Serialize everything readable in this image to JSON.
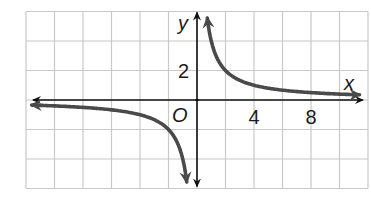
{
  "chart_data": {
    "type": "line",
    "title": "",
    "function": "y = 4/x",
    "xlabel": "x",
    "ylabel": "y",
    "origin_label": "O",
    "xlim": [
      -12,
      12
    ],
    "ylim": [
      -6,
      6
    ],
    "grid": true,
    "grid_step": 2,
    "x_tick_labels": [
      {
        "value": 4,
        "label": "4"
      },
      {
        "value": 8,
        "label": "8"
      }
    ],
    "y_tick_labels": [
      {
        "value": 2,
        "label": "2"
      }
    ],
    "series": [
      {
        "name": "branch-positive",
        "x": [
          0.7,
          1,
          2,
          4,
          8,
          11.5
        ],
        "y": [
          5.7,
          4,
          2,
          1,
          0.5,
          0.35
        ]
      },
      {
        "name": "branch-negative",
        "x": [
          -12,
          -8,
          -4,
          -2,
          -1,
          -0.7
        ],
        "y": [
          -0.33,
          -0.5,
          -1,
          -2,
          -4,
          -5.7
        ]
      }
    ],
    "curve_color": "#4a4a4a",
    "axis_color": "#111111",
    "grid_color": "#c8c8c8"
  }
}
